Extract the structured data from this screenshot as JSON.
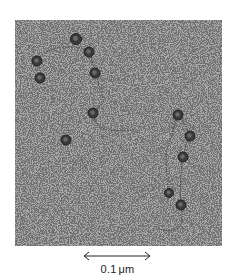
{
  "figure": {
    "type": "electron-micrograph",
    "background_color": "#a9a9a9",
    "speckle_color": "#2a2a2a",
    "particle_color": "#3a3a3a",
    "particles": [
      {
        "x": 61,
        "y": 19,
        "r": 5.5
      },
      {
        "x": 74,
        "y": 32,
        "r": 5
      },
      {
        "x": 22,
        "y": 41,
        "r": 5
      },
      {
        "x": 80,
        "y": 53,
        "r": 5
      },
      {
        "x": 25,
        "y": 58,
        "r": 5
      },
      {
        "x": 78,
        "y": 93,
        "r": 5
      },
      {
        "x": 51,
        "y": 120,
        "r": 5
      },
      {
        "x": 163,
        "y": 95,
        "r": 5
      },
      {
        "x": 175,
        "y": 116,
        "r": 5
      },
      {
        "x": 168,
        "y": 137,
        "r": 5
      },
      {
        "x": 154,
        "y": 173,
        "r": 4.5
      },
      {
        "x": 166,
        "y": 185,
        "r": 5
      }
    ],
    "strands": [
      "M 22 41 Q 30 28 50 27 Q 65 26 74 32",
      "M 74 32 Q 78 42 80 53 Q 86 70 88 80 Q 84 88 78 93",
      "M 78 93 Q 80 108 95 110 Q 110 112 120 109",
      "M 163 95 Q 158 110 152 130 Q 150 150 154 173",
      "M 163 95 Q 172 105 175 116 Q 170 126 168 137 Q 164 160 166 185",
      "M 166 185 Q 170 205 160 210 Q 145 212 140 205"
    ]
  },
  "scale_bar": {
    "value": "0.1",
    "unit": "μm"
  }
}
